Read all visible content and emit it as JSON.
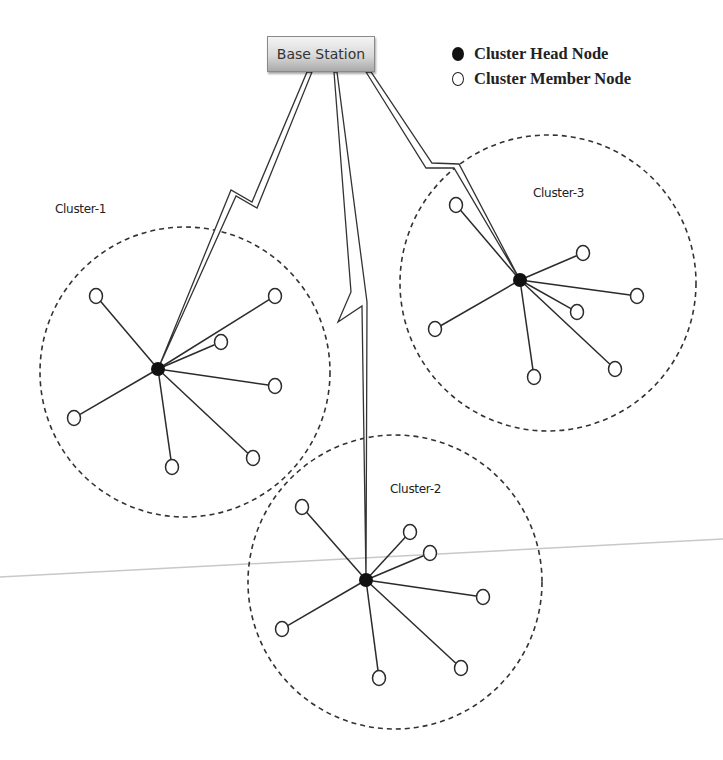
{
  "diagram": {
    "base_station": {
      "label": "Base Station",
      "x": 321,
      "y": 54
    },
    "legend": {
      "items": [
        {
          "symbol": "filled-circle",
          "label": "Cluster Head Node"
        },
        {
          "symbol": "hollow-circle",
          "label": "Cluster Member Node"
        }
      ]
    },
    "clusters": [
      {
        "label": "Cluster-1",
        "label_pos": [
          55,
          210
        ],
        "circle": {
          "cx": 185,
          "cy": 372,
          "r": 145
        },
        "head": [
          158,
          369
        ],
        "members": [
          [
            96,
            296
          ],
          [
            275,
            296
          ],
          [
            221,
            342
          ],
          [
            275,
            386
          ],
          [
            74,
            418
          ],
          [
            172,
            467
          ],
          [
            253,
            458
          ]
        ]
      },
      {
        "label": "Cluster-2",
        "label_pos": [
          390,
          490
        ],
        "circle": {
          "cx": 395,
          "cy": 582,
          "r": 147
        },
        "head": [
          366,
          580
        ],
        "members": [
          [
            302,
            507
          ],
          [
            410,
            532
          ],
          [
            430,
            553
          ],
          [
            483,
            597
          ],
          [
            282,
            629
          ],
          [
            379,
            678
          ],
          [
            461,
            668
          ]
        ]
      },
      {
        "label": "Cluster-3",
        "label_pos": [
          533,
          194
        ],
        "circle": {
          "cx": 548,
          "cy": 283,
          "r": 148
        },
        "head": [
          520,
          280
        ],
        "members": [
          [
            456,
            205
          ],
          [
            583,
            253
          ],
          [
            637,
            296
          ],
          [
            577,
            312
          ],
          [
            435,
            329
          ],
          [
            534,
            377
          ],
          [
            615,
            369
          ]
        ]
      }
    ],
    "links": [
      {
        "from": "Base Station",
        "to": "Cluster-1 head",
        "style": "lightning-bolt"
      },
      {
        "from": "Base Station",
        "to": "Cluster-2 head",
        "style": "lightning-bolt"
      },
      {
        "from": "Base Station",
        "to": "Cluster-3 head",
        "style": "lightning-bolt"
      }
    ],
    "colors": {
      "line": "#2b2b2b",
      "head_fill": "#111111",
      "member_fill": "#ffffff",
      "divider": "#c8c8c8"
    }
  }
}
